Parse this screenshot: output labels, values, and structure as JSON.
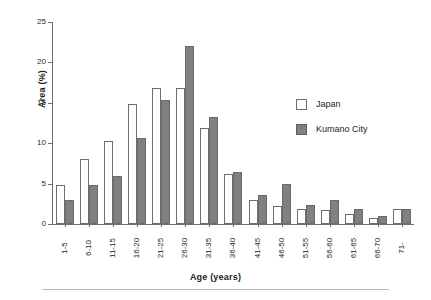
{
  "chart_data": {
    "type": "bar",
    "title": "",
    "subtitle": "",
    "xlabel": "Age (years)",
    "ylabel": "Area (%)",
    "ylim": [
      0,
      25
    ],
    "yticks": [
      0,
      5,
      10,
      15,
      20,
      25
    ],
    "grid": false,
    "legend_position": "upper right",
    "categories": [
      "1-5",
      "6-10",
      "11-15",
      "16-20",
      "21-25",
      "26-30",
      "31-35",
      "36-40",
      "41-45",
      "46-50",
      "51-55",
      "56-60",
      "61-65",
      "66-70",
      "71-"
    ],
    "series": [
      {
        "name": "Japan",
        "color": "#ffffff",
        "values": [
          4.8,
          8.0,
          10.3,
          14.8,
          16.8,
          16.8,
          11.9,
          6.2,
          3.0,
          2.2,
          1.9,
          1.7,
          1.2,
          0.7,
          1.8
        ]
      },
      {
        "name": "Kumano City",
        "color": "#808080",
        "values": [
          3.0,
          4.8,
          6.0,
          10.6,
          15.3,
          22.0,
          13.3,
          6.4,
          3.6,
          4.9,
          2.4,
          3.0,
          1.8,
          1.0,
          1.8
        ]
      }
    ]
  },
  "legend": {
    "items": [
      {
        "label": "Japan",
        "swatch": "japan"
      },
      {
        "label": "Kumano City",
        "swatch": "kumano"
      }
    ]
  },
  "colors": {
    "japan_fill": "#ffffff",
    "kumano_fill": "#808080",
    "axis": "#6d6e70",
    "text": "#231f20",
    "rule": "#b8b8b8"
  }
}
